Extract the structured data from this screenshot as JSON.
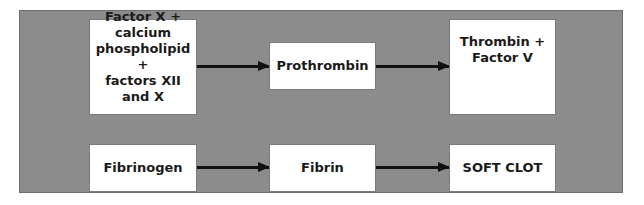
{
  "diagram": {
    "colors": {
      "panel": "#8c8c8c",
      "box": "#ffffff",
      "arrow": "#111111",
      "text": "#1a1a1a"
    },
    "top_row": [
      {
        "id": "factor-x-complex",
        "label": "Factor X + calcium\nphospholipid +\nfactors XII and X"
      },
      {
        "id": "prothrombin",
        "label": "Prothrombin"
      },
      {
        "id": "thrombin-factor-v",
        "label": "Thrombin +\nFactor V"
      }
    ],
    "bottom_row": [
      {
        "id": "fibrinogen",
        "label": "Fibrinogen"
      },
      {
        "id": "fibrin",
        "label": "Fibrin"
      },
      {
        "id": "soft-clot",
        "label": "SOFT CLOT"
      }
    ],
    "edges": [
      {
        "from": "factor-x-complex",
        "to": "prothrombin"
      },
      {
        "from": "prothrombin",
        "to": "thrombin-factor-v"
      },
      {
        "from": "fibrinogen",
        "to": "fibrin"
      },
      {
        "from": "fibrin",
        "to": "soft-clot"
      }
    ]
  }
}
